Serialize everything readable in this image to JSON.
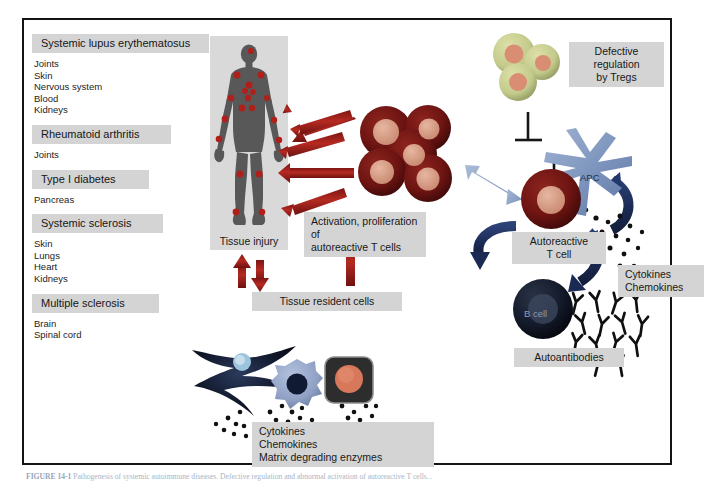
{
  "figure": {
    "caption_prefix": "FIGURE 14-1",
    "caption_text": "  Pathogenesis of systemic autoimmune diseases. Defective regulation and abnormal activation of autoreactive T cells..."
  },
  "disease_list": [
    {
      "name": "Systemic lupus erythematosus",
      "head_width": 168,
      "organs": [
        "Joints",
        "Skin",
        "Nervous system",
        "Blood",
        "Kidneys"
      ]
    },
    {
      "name": "Rheumatoid arthritis",
      "head_width": 130,
      "organs": [
        "Joints"
      ]
    },
    {
      "name": "Type I diabetes",
      "head_width": 108,
      "organs": [
        "Pancreas"
      ]
    },
    {
      "name": "Systemic sclerosis",
      "head_width": 122,
      "organs": [
        "Skin",
        "Lungs",
        "Heart",
        "Kidneys"
      ]
    },
    {
      "name": "Multiple sclerosis",
      "head_width": 118,
      "organs": [
        "Brain",
        "Spinal cord"
      ]
    }
  ],
  "labels": {
    "tissue_injury": "Tissue injury",
    "defective_treg": "Defective\nregulation\nby Tregs",
    "activation": "Activation, proliferation of\nautoreactive T cells",
    "tissue_resident": "Tissue resident cells",
    "autoreactive_tcell": "Autoreactive\nT cell",
    "cytokines_right": "Cytokines\nChemokines",
    "autoantibodies": "Autoantibodies",
    "cytokines_bottom": "Cytokines\nChemokines\nMatrix degrading enzymes",
    "apc": "APC",
    "bcell": "B cell"
  },
  "colors": {
    "label_box": "#d4d4d4",
    "panel_box": "#d9d9d9",
    "frame_border": "#141414",
    "red_arrow": "#9c1f1a",
    "dark_red_cell": "#6d1412",
    "cell_nucleus": "#d99a84",
    "treg_body": "#c9cf92",
    "apc_blue": "#7b93bc",
    "navy_arrow": "#20325f",
    "light_blue_arrow": "#8ea4c7",
    "bcell_dark": "#131a2a",
    "body_grey": "#585858",
    "body_spot": "#b0201b",
    "fibroblast": "#0c1020",
    "macrophage": "#8fa0c4",
    "epithelial_box": "#2a2a2a"
  },
  "icons": {
    "human_body": "human-body-icon",
    "tcell_cluster": "t-cell-cluster-icon",
    "treg_cluster": "treg-cluster-icon",
    "apc": "dendritic-cell-icon",
    "bcell": "b-cell-icon",
    "antibody": "antibody-y-icon",
    "fibroblast": "fibroblast-icon",
    "macrophage": "macrophage-icon",
    "epithelial": "epithelial-cell-icon"
  }
}
